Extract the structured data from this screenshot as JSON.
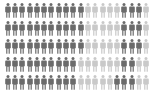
{
  "chart_data": {
    "type": "pictogram",
    "title": "",
    "xlabel": "",
    "ylabel": "",
    "icon": "person-icon",
    "units_per_row": 20,
    "rows": [
      {
        "pattern": [
          {
            "color": "dark",
            "count": 11
          },
          {
            "color": "light",
            "count": 5
          },
          {
            "color": "dark",
            "count": 3
          },
          {
            "color": "light",
            "count": 1
          }
        ]
      },
      {
        "pattern": [
          {
            "color": "dark",
            "count": 11
          },
          {
            "color": "light",
            "count": 5
          },
          {
            "color": "dark",
            "count": 3
          },
          {
            "color": "light",
            "count": 1
          }
        ]
      },
      {
        "pattern": [
          {
            "color": "dark",
            "count": 11
          },
          {
            "color": "light",
            "count": 5
          },
          {
            "color": "dark",
            "count": 3
          },
          {
            "color": "light",
            "count": 1
          }
        ]
      },
      {
        "pattern": [
          {
            "color": "dark",
            "count": 10
          },
          {
            "color": "light",
            "count": 6
          },
          {
            "color": "dark",
            "count": 2
          },
          {
            "color": "light",
            "count": 2
          }
        ]
      },
      {
        "pattern": [
          {
            "color": "dark",
            "count": 10
          },
          {
            "color": "light",
            "count": 5
          },
          {
            "color": "dark",
            "count": 3
          },
          {
            "color": "light",
            "count": 2
          }
        ]
      }
    ],
    "totals": {
      "dark": 69,
      "light": 31,
      "total": 100
    },
    "colors": {
      "dark": "#6b6b6b",
      "light": "#c9c9c9"
    },
    "grid": false,
    "legend": null
  }
}
